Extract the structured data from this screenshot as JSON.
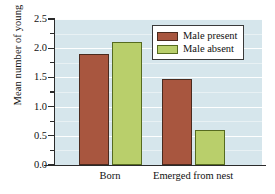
{
  "chart_data": {
    "type": "bar",
    "title": "",
    "xlabel": "",
    "ylabel": "Mean number of young",
    "categories": [
      "Born",
      "Emerged from nest"
    ],
    "series": [
      {
        "name": "Male present",
        "values": [
          1.9,
          1.48
        ],
        "color": "#a8563f"
      },
      {
        "name": "Male absent",
        "values": [
          2.1,
          0.6
        ],
        "color": "#b9cf6b"
      }
    ],
    "ylim": [
      0.0,
      2.5
    ],
    "ytick_labels": [
      "0.0",
      "0.5",
      "1.0",
      "1.5",
      "2.0",
      "2.5"
    ],
    "ytick_values": [
      0.0,
      0.5,
      1.0,
      1.5,
      2.0,
      2.5
    ],
    "yminor_tick_values": [
      0.25,
      0.75,
      1.25,
      1.75,
      2.25
    ],
    "grid": true,
    "grid_color": "#ffffff",
    "plot_background": "#d6e6ec",
    "legend_position": "top-right",
    "legend_entries": [
      "Male present",
      "Male absent"
    ]
  },
  "legend": {
    "present_label": "Male present",
    "absent_label": "Male absent"
  },
  "axes": {
    "y_title": "Mean number of young",
    "x_category_0": "Born",
    "x_category_1": "Emerged from nest"
  }
}
